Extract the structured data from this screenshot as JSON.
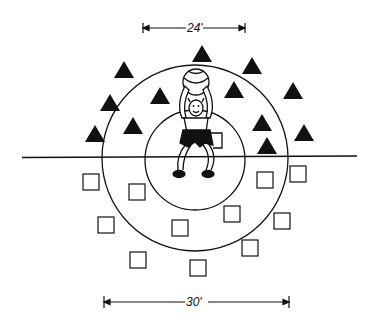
{
  "diagram": {
    "dimensions": {
      "inner_diameter_label": "24'",
      "outer_diameter_label": "30'"
    },
    "colors": {
      "ink": "#111111",
      "background": "#ffffff"
    },
    "field": {
      "center": [
        195,
        158
      ],
      "inner_circle_radius": 50,
      "outer_circle_radius": 93,
      "midline": {
        "x1": 22,
        "x2": 357,
        "y": 157
      }
    },
    "team_triangles": [
      [
        124,
        70
      ],
      [
        202,
        54
      ],
      [
        252,
        66
      ],
      [
        110,
        103
      ],
      [
        160,
        96
      ],
      [
        234,
        90
      ],
      [
        293,
        91
      ],
      [
        95,
        134
      ],
      [
        133,
        126
      ],
      [
        262,
        123
      ],
      [
        304,
        133
      ],
      [
        267,
        146
      ]
    ],
    "team_squares": [
      [
        91,
        182
      ],
      [
        137,
        192
      ],
      [
        265,
        180
      ],
      [
        298,
        174
      ],
      [
        106,
        225
      ],
      [
        180,
        228
      ],
      [
        232,
        214
      ],
      [
        282,
        221
      ],
      [
        138,
        260
      ],
      [
        198,
        268
      ],
      [
        250,
        248
      ]
    ],
    "player": {
      "role": "center-thrower",
      "holding": "ball"
    }
  }
}
